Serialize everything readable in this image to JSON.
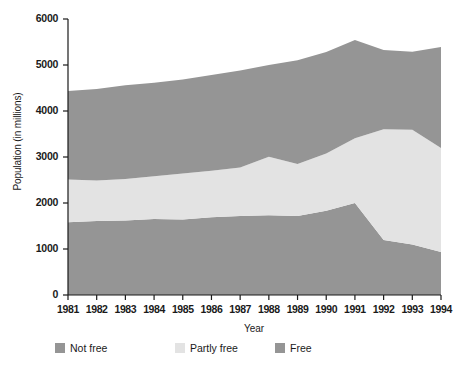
{
  "chart_data": {
    "type": "area",
    "stacked": true,
    "title": "",
    "xlabel": "Year",
    "ylabel": "Population (in millions)",
    "x": [
      1981,
      1982,
      1983,
      1984,
      1985,
      1986,
      1987,
      1988,
      1989,
      1990,
      1991,
      1992,
      1993,
      1994
    ],
    "xtick_labels": [
      "1981",
      "1982",
      "1983",
      "1984",
      "1985",
      "1986",
      "1987",
      "1988",
      "1989",
      "1990",
      "1991",
      "1992",
      "1993",
      "1994"
    ],
    "ytick_labels": [
      "0",
      "1000",
      "2000",
      "3000",
      "4000",
      "5000",
      "6000"
    ],
    "yticks": [
      0,
      1000,
      2000,
      3000,
      4000,
      5000,
      6000
    ],
    "ylim": [
      0,
      6000
    ],
    "xlim": [
      1981,
      1994
    ],
    "grid": false,
    "legend_position": "bottom",
    "series": [
      {
        "name": "Free",
        "color": "#959595",
        "order": 1,
        "values": [
          1580,
          1610,
          1620,
          1650,
          1640,
          1690,
          1720,
          1735,
          1720,
          1830,
          2000,
          1195,
          1100,
          935
        ]
      },
      {
        "name": "Partly free",
        "color": "#e3e3e3",
        "order": 2,
        "values": [
          930,
          880,
          900,
          930,
          1000,
          1010,
          1050,
          1270,
          1130,
          1245,
          1410,
          2410,
          2490,
          2260
        ]
      },
      {
        "name": "Not free",
        "color": "#959595",
        "order": 3,
        "values": [
          1925,
          1990,
          2040,
          2035,
          2045,
          2080,
          2110,
          1995,
          2255,
          2205,
          2135,
          1720,
          1700,
          2195
        ]
      }
    ],
    "cumulative_totals": [
      4435,
      4480,
      4560,
      4615,
      4685,
      4780,
      4880,
      5000,
      5105,
      5280,
      5545,
      5325,
      5290,
      5390
    ],
    "boundary_free_top": [
      1580,
      1610,
      1620,
      1650,
      1640,
      1690,
      1720,
      1735,
      1720,
      1830,
      2000,
      1195,
      1100,
      935
    ],
    "boundary_partly_top": [
      2510,
      2490,
      2520,
      2580,
      2640,
      2700,
      2770,
      3005,
      2850,
      3075,
      3410,
      3605,
      3590,
      3195
    ]
  },
  "legend": {
    "items": [
      {
        "label": "Not free",
        "color": "#959595"
      },
      {
        "label": "Partly free",
        "color": "#e3e3e3"
      },
      {
        "label": "Free",
        "color": "#959595"
      }
    ]
  }
}
